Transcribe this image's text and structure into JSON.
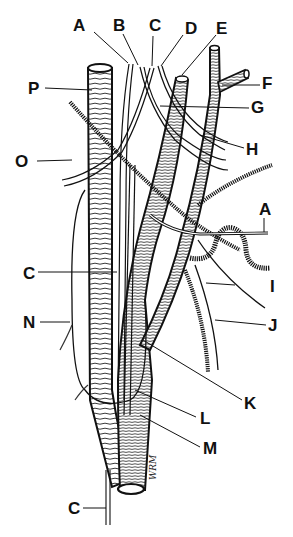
{
  "figure": {
    "type": "anatomical line drawing",
    "colors": {
      "stroke": "#111111",
      "background": "#ffffff"
    },
    "signature": "WRM",
    "labels": [
      {
        "id": "A_top",
        "text": "A",
        "x": 73,
        "y": 17
      },
      {
        "id": "B",
        "text": "B",
        "x": 113,
        "y": 17
      },
      {
        "id": "C_top",
        "text": "C",
        "x": 149,
        "y": 17
      },
      {
        "id": "D",
        "text": "D",
        "x": 185,
        "y": 20
      },
      {
        "id": "E",
        "text": "E",
        "x": 216,
        "y": 20
      },
      {
        "id": "F",
        "text": "F",
        "x": 262,
        "y": 75
      },
      {
        "id": "G",
        "text": "G",
        "x": 251,
        "y": 99
      },
      {
        "id": "H",
        "text": "H",
        "x": 246,
        "y": 141
      },
      {
        "id": "P",
        "text": "P",
        "x": 28,
        "y": 80
      },
      {
        "id": "O",
        "text": "O",
        "x": 15,
        "y": 153
      },
      {
        "id": "A_right",
        "text": "A",
        "x": 259,
        "y": 201
      },
      {
        "id": "C_mid",
        "text": "C",
        "x": 23,
        "y": 265
      },
      {
        "id": "I",
        "text": "I",
        "x": 270,
        "y": 278
      },
      {
        "id": "N",
        "text": "N",
        "x": 23,
        "y": 314
      },
      {
        "id": "J",
        "text": "J",
        "x": 268,
        "y": 317
      },
      {
        "id": "K",
        "text": "K",
        "x": 244,
        "y": 395
      },
      {
        "id": "L",
        "text": "L",
        "x": 200,
        "y": 410
      },
      {
        "id": "M",
        "text": "M",
        "x": 203,
        "y": 440
      },
      {
        "id": "C_bottom",
        "text": "C",
        "x": 68,
        "y": 500
      }
    ]
  }
}
